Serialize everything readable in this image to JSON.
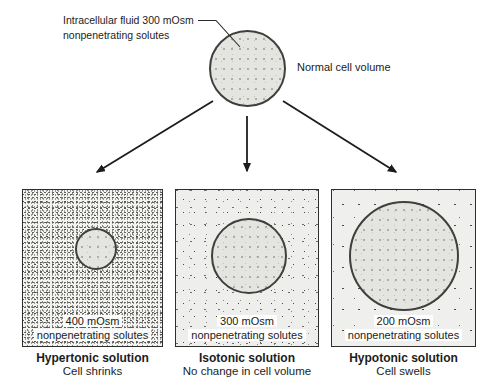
{
  "colors": {
    "background": "#ffffff",
    "ink": "#1c1c1c",
    "cell_fill": "#e4e4e0",
    "panel_border": "#2e2e2c",
    "cell_border": "#3f3f3c"
  },
  "top": {
    "annotation_line1": "Intracellular fluid 300 mOsm",
    "annotation_line2": "nonpenetrating solutes",
    "cell_label": "Normal cell volume"
  },
  "panels": [
    {
      "name": "hypertonic",
      "osmolarity": "400 mOsm",
      "solutes": "nonpenetrating solutes",
      "caption_title": "Hypertonic solution",
      "caption_subtitle": "Cell shrinks"
    },
    {
      "name": "isotonic",
      "osmolarity": "300 mOsm",
      "solutes": "nonpenetrating solutes",
      "caption_title": "Isotonic solution",
      "caption_subtitle": "No change in cell volume"
    },
    {
      "name": "hypotonic",
      "osmolarity": "200 mOsm",
      "solutes": "nonpenetrating solutes",
      "caption_title": "Hypotonic solution",
      "caption_subtitle": "Cell swells"
    }
  ]
}
